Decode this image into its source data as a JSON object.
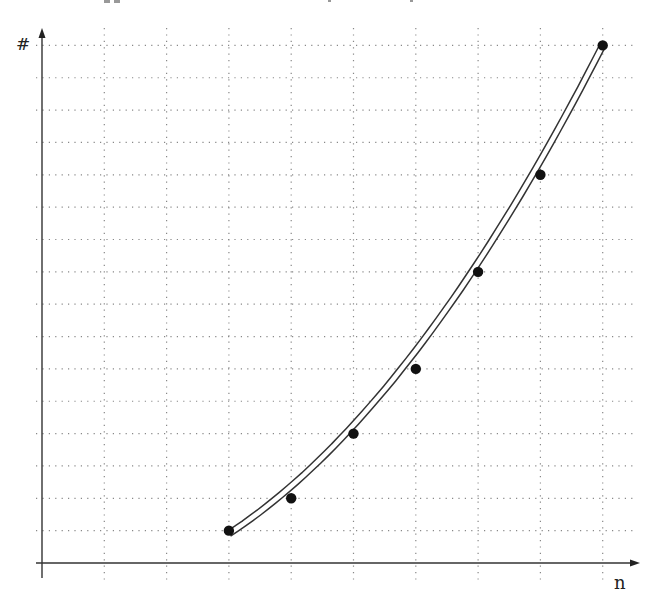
{
  "chart_data": {
    "type": "scatter",
    "title": "",
    "xlabel": "n",
    "ylabel": "#",
    "x": [
      3,
      4,
      5,
      6,
      7,
      8,
      9
    ],
    "y": [
      1,
      2,
      4,
      6,
      9,
      12,
      16
    ],
    "series": [
      {
        "name": "points",
        "style": "markers",
        "x": [
          3,
          4,
          5,
          6,
          7,
          8,
          9
        ],
        "y": [
          1,
          2,
          4,
          6,
          9,
          12,
          16
        ]
      },
      {
        "name": "fitted curve",
        "style": "double-line",
        "x_range": [
          3,
          9
        ]
      }
    ],
    "xlim": [
      0,
      9.5
    ],
    "ylim": [
      0,
      16.5
    ],
    "grid": {
      "on": true,
      "style": "dotted",
      "x_step": 1,
      "y_step": 1,
      "x_lines": 9,
      "y_lines": 16
    },
    "tick_labels": false,
    "legend": null
  },
  "axes": {
    "x_label": "n",
    "y_label": "#"
  },
  "colors": {
    "axis": "#333333",
    "grid": "#888888",
    "curve": "#333333",
    "points": "#111111"
  }
}
